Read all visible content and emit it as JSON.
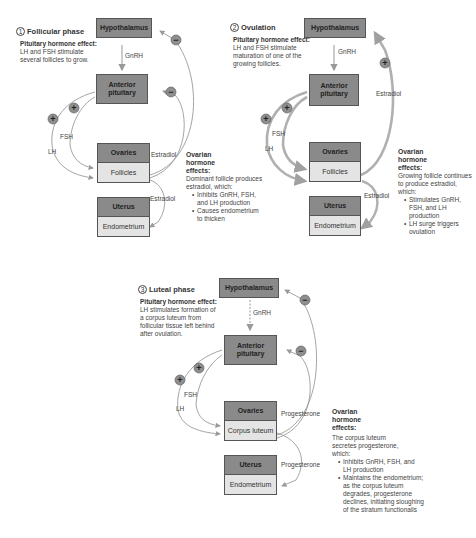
{
  "panels": [
    {
      "number": "1",
      "title": "Follicular phase",
      "pituitary_effect": {
        "label": "Pituitary hormone effect:",
        "text": "LH and FSH stimulate several follicles to grow."
      },
      "boxes": {
        "hypothalamus": "Hypothalamus",
        "anterior_pituitary": "Anterior pituitary",
        "ovaries": "Ovaries",
        "ovaries_sub": "Follicles",
        "uterus": "Uterus",
        "uterus_sub": "Endometrium"
      },
      "arrow_labels": {
        "gnrh": "GnRH",
        "fsh": "FSH",
        "lh": "LH",
        "ovary_out": "Estradiol",
        "uterus_in": "Estradiol"
      },
      "feedback_signs": [
        "−",
        "−",
        "+",
        "+"
      ],
      "ovarian_effect": {
        "title": "Ovarian hormone effects:",
        "intro": "Dominant follicle produces estradiol, which:",
        "bullets": [
          "Inhibits GnRH, FSH, and LH production",
          "Causes endometrium to thicken"
        ]
      }
    },
    {
      "number": "2",
      "title": "Ovulation",
      "pituitary_effect": {
        "label": "Pituitary hormone effect:",
        "text": "LH and FSH stimulate maturation of one of the growing follicles."
      },
      "boxes": {
        "hypothalamus": "Hypothalamus",
        "anterior_pituitary": "Anterior pituitary",
        "ovaries": "Ovaries",
        "ovaries_sub": "Follicles",
        "uterus": "Uterus",
        "uterus_sub": "Endometrium"
      },
      "arrow_labels": {
        "gnrh": "GnRH",
        "fsh": "FSH",
        "lh": "LH",
        "feedback": "Estradiol",
        "uterus_in": "Estradiol"
      },
      "feedback_signs": [
        "+",
        "+",
        "+"
      ],
      "ovarian_effect": {
        "title": "Ovarian hormone effects:",
        "intro": "Growing follicle continues to produce estradiol, which:",
        "bullets": [
          "Stimulates GnRH, FSH, and LH production",
          "LH surge triggers ovulation"
        ]
      }
    },
    {
      "number": "3",
      "title": "Luteal phase",
      "pituitary_effect": {
        "label": "Pituitary hormone effect:",
        "text": "LH stimulates formation of a corpus luteum from follicular tissue left behind after ovulation."
      },
      "boxes": {
        "hypothalamus": "Hypothalamus",
        "anterior_pituitary": "Anterior pituitary",
        "ovaries": "Ovaries",
        "ovaries_sub": "Corpus luteum",
        "uterus": "Uterus",
        "uterus_sub": "Endometrium"
      },
      "arrow_labels": {
        "gnrh": "GnRH",
        "fsh": "FSH",
        "lh": "LH",
        "ovary_out": "Progesterone",
        "uterus_in": "Progesterone"
      },
      "feedback_signs": [
        "−",
        "−",
        "+",
        "+"
      ],
      "ovarian_effect": {
        "title": "Ovarian hormone effects:",
        "intro": "The corpus luteum secretes progesterone, which:",
        "bullets": [
          "Inhibits GnRH, FSH, and LH production",
          "Maintains the endometrium; as the corpus luteum degrades, progesterone declines, initiating sloughing of the stratum functionalis"
        ]
      }
    }
  ],
  "colors": {
    "box_dark": "#8a8a8a",
    "box_light": "#e4e4e4",
    "arrow": "#9a9a9a",
    "arrow_thick": "#a8a8a8",
    "sign_fill": "#8f8f8f"
  }
}
